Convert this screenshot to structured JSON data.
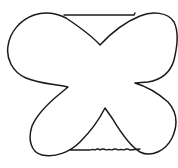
{
  "drawing": {
    "description": "Hand-drawn four-lobed outline shape with horizontal lines across top and bottom notches",
    "stroke_color": "#1a1a1a",
    "background_color": "#ffffff"
  }
}
